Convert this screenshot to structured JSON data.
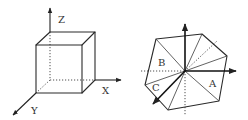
{
  "figure": {
    "left_panel": {
      "description": "cube with 3D coordinate axes",
      "axis_labels": {
        "z": "Z",
        "x": "X",
        "y": "Y"
      }
    },
    "right_panel": {
      "description": "hexagonal projection of cube divided into triangular regions",
      "region_labels": {
        "a": "A",
        "b": "B",
        "c": "C"
      }
    }
  }
}
